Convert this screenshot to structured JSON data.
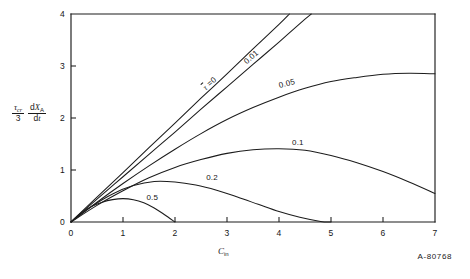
{
  "figure": {
    "id_label": "A-80768",
    "ylabel_parts": {
      "frac_num": "τcr",
      "frac_den": "3",
      "deriv_num": "dXA",
      "deriv_den": "dt"
    },
    "xlabel": "Cin"
  },
  "chart_data": {
    "type": "line",
    "title": "",
    "xlabel": "Cin",
    "ylabel": "(τcr/3) dXA/dt",
    "xlim": [
      0,
      7
    ],
    "ylim": [
      0,
      4
    ],
    "xticks": [
      0,
      1,
      2,
      3,
      4,
      5,
      6,
      7
    ],
    "xtick_labels": [
      "0",
      "1",
      "2",
      "3",
      "4",
      "5",
      "6",
      "7"
    ],
    "yticks": [
      0,
      1,
      2,
      3,
      4
    ],
    "ytick_labels": [
      "0",
      "1",
      "2",
      "3",
      "4"
    ],
    "grid": false,
    "legend": "inline-curve-labels",
    "series": [
      {
        "name": "τ = 0",
        "label": "τ =0",
        "label_x": 2.55,
        "label_y": 2.55,
        "label_rotation": -41,
        "x": [
          0,
          0.5,
          1,
          1.5,
          2,
          2.5,
          3,
          3.5,
          4,
          4.2
        ],
        "y": [
          0,
          0.48,
          0.95,
          1.43,
          1.9,
          2.38,
          2.85,
          3.33,
          3.8,
          4.0
        ]
      },
      {
        "name": "0.01",
        "label": "0.01",
        "label_x": 3.35,
        "label_y": 3.05,
        "label_rotation": -41,
        "x": [
          0,
          0.5,
          1,
          1.5,
          2,
          2.5,
          3,
          3.5,
          4,
          4.5,
          4.62
        ],
        "y": [
          0,
          0.44,
          0.87,
          1.3,
          1.73,
          2.17,
          2.6,
          3.03,
          3.46,
          3.9,
          4.0
        ]
      },
      {
        "name": "0.05",
        "label": "0.05",
        "label_x": 4.0,
        "label_y": 2.62,
        "label_rotation": -14,
        "x": [
          0,
          0.5,
          1,
          1.5,
          2,
          2.5,
          3,
          3.5,
          4,
          4.5,
          5,
          5.5,
          6,
          6.5,
          7
        ],
        "y": [
          0,
          0.38,
          0.74,
          1.08,
          1.4,
          1.7,
          1.97,
          2.2,
          2.4,
          2.57,
          2.7,
          2.78,
          2.84,
          2.86,
          2.85
        ]
      },
      {
        "name": "0.1",
        "label": "0.1",
        "label_x": 4.25,
        "label_y": 1.52,
        "label_rotation": 0,
        "x": [
          0,
          0.5,
          1,
          1.5,
          2,
          2.5,
          3,
          3.5,
          4,
          4.5,
          5,
          5.5,
          6,
          6.5,
          7
        ],
        "y": [
          0,
          0.32,
          0.6,
          0.85,
          1.05,
          1.2,
          1.32,
          1.39,
          1.41,
          1.38,
          1.28,
          1.14,
          0.97,
          0.77,
          0.55
        ]
      },
      {
        "name": "0.2",
        "label": "0.2",
        "label_x": 2.6,
        "label_y": 0.85,
        "label_rotation": 0,
        "x": [
          0,
          0.4,
          0.8,
          1.2,
          1.6,
          2,
          2.4,
          2.8,
          3.2,
          3.6,
          4,
          4.4,
          4.8,
          5
        ],
        "y": [
          0,
          0.3,
          0.54,
          0.7,
          0.78,
          0.77,
          0.71,
          0.61,
          0.48,
          0.34,
          0.2,
          0.09,
          0.01,
          0
        ]
      },
      {
        "name": "0.5",
        "label": "0.5",
        "label_x": 1.45,
        "label_y": 0.47,
        "label_rotation": 0,
        "x": [
          0,
          0.2,
          0.4,
          0.6,
          0.8,
          1.0,
          1.2,
          1.4,
          1.6,
          1.8,
          2.0
        ],
        "y": [
          0,
          0.18,
          0.3,
          0.38,
          0.43,
          0.45,
          0.43,
          0.37,
          0.27,
          0.14,
          0
        ]
      }
    ]
  }
}
